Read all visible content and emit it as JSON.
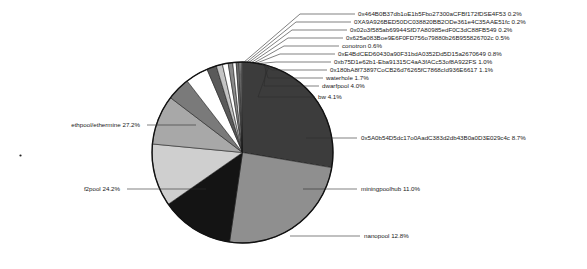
{
  "chart_data": {
    "type": "pie",
    "title": "",
    "legend_position": "callout-labels",
    "label_format": "name percent",
    "start_angle_deg": 90,
    "direction": "clockwise",
    "categories": [
      "ethpool/ethermine",
      "f2pool",
      "nanopool",
      "miningpoolhub",
      "0x5A0b54D5dc17o0AadC383d2db43B0a0D3E029c4c",
      "bw",
      "dwarfpool",
      "waterhole",
      "0x180bA8f73897CoCB26d76265fC7868cId936E6617",
      "0xb75D1e62b1-Eba91315C4aA3fACc53of8A922FS",
      "0xE4BdCED60430a90F31bdA0352Dd5D15a2670649",
      "conotron",
      "0x625a083Boe9E6F0FD756o79880b26B955826702c",
      "0x02o3f585ab69944SfD7A80985edF0C3dC88FB549",
      "0XA9A926BED50DC038820BB2ODe361e4C35AAE51fc",
      "0x464B0B37db1oE1b5Fbo27300aCFBf172fDSE4F53"
    ],
    "values": [
      27.2,
      24.2,
      12.8,
      11.0,
      8.7,
      4.1,
      4.0,
      1.7,
      1.1,
      1.0,
      0.8,
      0.6,
      0.5,
      0.2,
      0.2,
      0.2
    ],
    "labels": [
      "ethpool/ethermine 27.2%",
      "f2pool 24.2%",
      "nanopool 12.8%",
      "miningpoolhub 11.0%",
      "0x5A0b54D5dc17o0AadC383d2db43B0a0D3E029c4c 8.7%",
      "bw 4.1%",
      "dwarfpool 4.0%",
      "waterhole 1.7%",
      "0x180bA8f73897CoCB26d76265fC7868cId936E6617 1.1%",
      "0xb75D1e62b1-Eba91315C4aA3fACc53of8A922FS 1.0%",
      "0xE4BdCED60430a90F31bdA0352Dd5D15a2670649 0.8%",
      "conotron 0.6%",
      "0x625a083Boe9E6F0FD756o79880b26B955826702c 0.5%",
      "0x02o3f585ab69944SfD7A80985edF0C3dC88FB549 0.2%",
      "0XA9A926BED50DC038820BB2ODe361e4C35AAE51fc 0.2%",
      "0x464B0B37db1oE1b5Fbo27300aCFBf172fDSE4F53 0.2%"
    ],
    "colors": [
      "#3c3c3c",
      "#8f8f8f",
      "#141414",
      "#cfcfcf",
      "#a8a8a8",
      "#7a7a7a",
      "#ffffff",
      "#5a5a5a",
      "#c4c4c4",
      "#ffffff",
      "#8a8a8a",
      "#ffffff",
      "#6b6b6b",
      "#d6d6d6",
      "#ffffff",
      "#9c9c9c"
    ],
    "ylim": [
      0,
      100
    ],
    "grid": false
  },
  "callouts": {
    "left": [
      {
        "text": "ethpool/ethermine 27.2%",
        "text_x": 140,
        "text_y": 127,
        "line_x1": 147,
        "line_y1": 125,
        "line_x2": 196,
        "line_y2": 125
      },
      {
        "text": "f2pool 24.2%",
        "text_x": 120,
        "text_y": 191,
        "line_x1": 127,
        "line_y1": 189,
        "line_x2": 206,
        "line_y2": 189
      }
    ],
    "bottom": [
      {
        "text": "nanopool 12.8%",
        "text_x": 364,
        "text_y": 238,
        "line_x1": 290,
        "line_y1": 236,
        "line_x2": 360,
        "line_y2": 236
      }
    ],
    "right": [
      {
        "text": "0x5A0b54D5dc17o0AadC383d2db43B0a0D3E029c4c 8.7%",
        "text_x": 361,
        "text_y": 140,
        "line_x1": 306,
        "line_y1": 138,
        "line_x2": 357,
        "line_y2": 138
      },
      {
        "text": "miningpoolhub 11.0%",
        "text_x": 361,
        "text_y": 191,
        "line_x1": 303,
        "line_y1": 189,
        "line_x2": 357,
        "line_y2": 189
      }
    ],
    "stacked": [
      {
        "text": "0x464B0B37db1oE1b5Fbo27300aCFBf172fDSE4F53 0.2%",
        "y": 14,
        "stub_x": 300,
        "elbow_x": 355
      },
      {
        "text": "0XA9A926BED50DC038820BB2ODe361e4C35AAE51fc 0.2%",
        "y": 22,
        "stub_x": 296,
        "elbow_x": 351
      },
      {
        "text": "0x02o3f585ab69944SfD7A80985edF0C3dC88FB549 0.2%",
        "y": 30,
        "stub_x": 292,
        "elbow_x": 347
      },
      {
        "text": "0x625a083Boe9E6F0FD756o79880b26B955826702c 0.5%",
        "y": 38,
        "stub_x": 288,
        "elbow_x": 343
      },
      {
        "text": "conotron 0.6%",
        "y": 46,
        "stub_x": 284,
        "elbow_x": 339
      },
      {
        "text": "0xE4BdCED60430a90F31bdA0352Dd5D15a2670649 0.8%",
        "y": 54,
        "stub_x": 280,
        "elbow_x": 335
      },
      {
        "text": "0xb75D1e62b1-Eba91315C4aA3fACc53of8A922FS 1.0%",
        "y": 62,
        "stub_x": 276,
        "elbow_x": 331
      },
      {
        "text": "0x180bA8f73897CoCB26d76265fC7868cId936E6617 1.1%",
        "y": 70,
        "stub_x": 272,
        "elbow_x": 327
      },
      {
        "text": "waterhole 1.7%",
        "y": 78,
        "stub_x": 268,
        "elbow_x": 323
      },
      {
        "text": "dwarfpool 4.0%",
        "y": 86,
        "stub_x": 264,
        "elbow_x": 319
      },
      {
        "text": "bw 4.1%",
        "y": 97,
        "stub_x": 258,
        "elbow_x": 315
      }
    ]
  }
}
